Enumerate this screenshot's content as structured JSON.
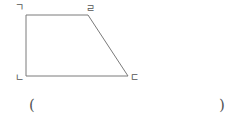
{
  "figure": {
    "shape": "trapezoid",
    "stroke_color": "#7a7a7a",
    "vertices": [
      {
        "label": "ㄱ",
        "x": 26,
        "y": 15,
        "position": "top-left"
      },
      {
        "label": "ㄹ",
        "x": 88,
        "y": 15,
        "position": "top-right"
      },
      {
        "label": "ㄷ",
        "x": 128,
        "y": 76,
        "position": "bottom-right"
      },
      {
        "label": "ㄴ",
        "x": 26,
        "y": 76,
        "position": "bottom-left"
      }
    ]
  },
  "answer": {
    "open_paren": "(",
    "close_paren": ")",
    "value": ""
  }
}
